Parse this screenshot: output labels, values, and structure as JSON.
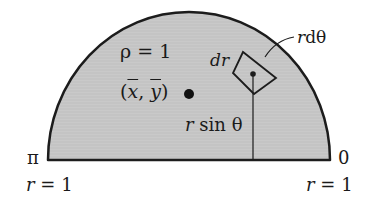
{
  "figure": {
    "type": "semicircular-lamina-centroid",
    "colors": {
      "fill": "#c8c8c8",
      "stroke": "#1c1c1c",
      "background": "#ffffff"
    },
    "labels": {
      "density": "ρ = 1",
      "centroid_open": "(",
      "centroid_x": "x",
      "centroid_comma": ", ",
      "centroid_y": "y",
      "centroid_close": ")",
      "dr": "dr",
      "r_dtheta_r": "r",
      "r_dtheta_rest": "dθ",
      "r_sin_r": "r",
      "r_sin_rest": " sin θ",
      "angle_left": "π",
      "angle_right": "0",
      "radius_left_r": "r",
      "radius_left_rest": " = 1",
      "radius_right_r": "r",
      "radius_right_rest": " = 1"
    }
  }
}
